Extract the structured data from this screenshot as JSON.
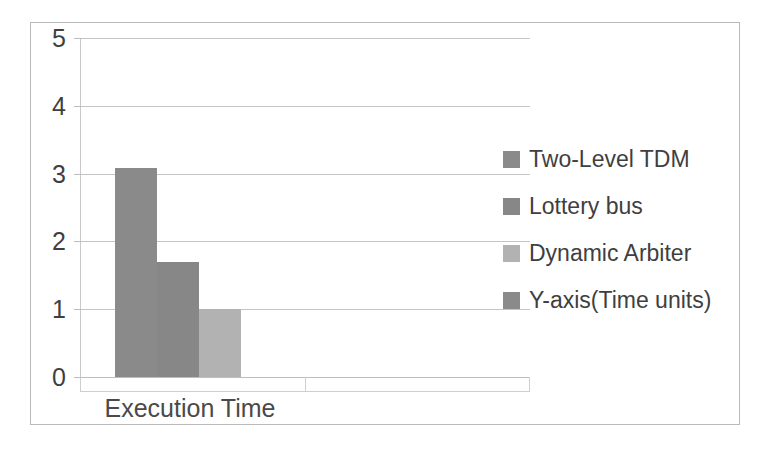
{
  "chart_data": {
    "type": "bar",
    "title": "",
    "subtitle": "",
    "categories": [
      "Execution Time"
    ],
    "xlabel": "Execution Time",
    "ylabel": "Y-axis(Time units)",
    "ylim": [
      0,
      5
    ],
    "y_ticks": [
      "5",
      "4",
      "3",
      "2",
      "1",
      "0"
    ],
    "y_tick_values": [
      5,
      4,
      3,
      2,
      1,
      0
    ],
    "grid": true,
    "legend_position": "right",
    "series": [
      {
        "name": "Two-Level TDM",
        "values": [
          3.08
        ],
        "color": "#8a8a8a"
      },
      {
        "name": "Lottery bus",
        "values": [
          1.7
        ],
        "color": "#878787"
      },
      {
        "name": "Dynamic Arbiter",
        "values": [
          1.0
        ],
        "color": "#b2b2b2"
      },
      {
        "name": "Y-axis(Time units)",
        "values": [
          0
        ],
        "color": "#8a8a8a"
      }
    ]
  },
  "legend": {
    "items": [
      {
        "label": "Two-Level TDM",
        "color": "#8a8a8a"
      },
      {
        "label": "Lottery bus",
        "color": "#878787"
      },
      {
        "label": "Dynamic Arbiter",
        "color": "#b2b2b2"
      },
      {
        "label": "Y-axis(Time units)",
        "color": "#8a8a8a"
      }
    ]
  },
  "axes": {
    "y_labels": [
      "5",
      "4",
      "3",
      "2",
      "1",
      "0"
    ],
    "x_category_label": "Execution Time"
  },
  "colors": {
    "frame": "#b9b9b9",
    "gridline": "#c4c4c4",
    "axis": "#cfcfcf",
    "text": "#3f3f3f",
    "background": "#ffffff"
  }
}
